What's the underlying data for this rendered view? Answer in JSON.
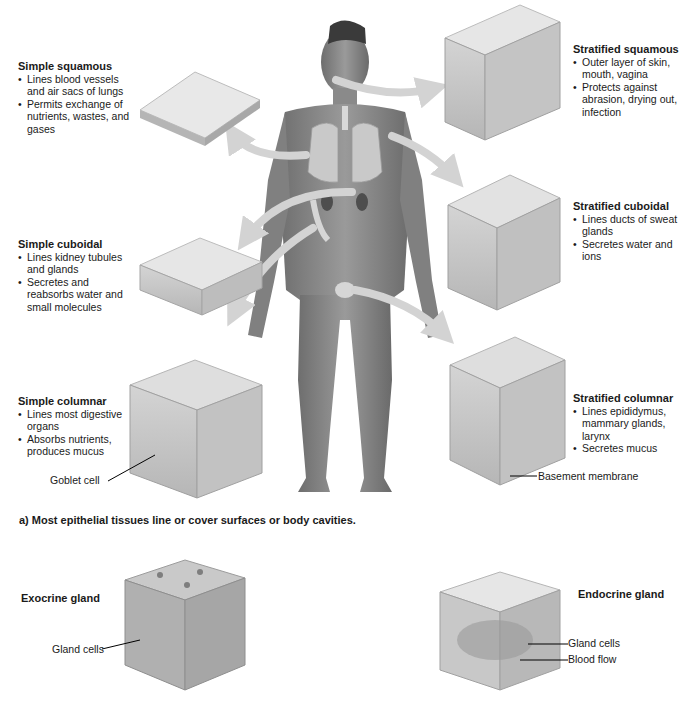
{
  "figure": {
    "caption": "a) Most epithelial tissues line or cover surfaces or body cavities.",
    "central_image": "human-body-front-view",
    "tissues": [
      {
        "id": "simple-squamous",
        "title": "Simple squamous",
        "bullets": [
          "Lines blood vessels and air sacs of lungs",
          "Permits exchange of nutrients, wastes, and gases"
        ],
        "source_organ": "lungs"
      },
      {
        "id": "simple-cuboidal",
        "title": "Simple cuboidal",
        "bullets": [
          "Lines kidney tubules and glands",
          "Secretes and reabsorbs water and small molecules"
        ],
        "source_organ": "kidneys"
      },
      {
        "id": "simple-columnar",
        "title": "Simple columnar",
        "bullets": [
          "Lines most digestive organs",
          "Absorbs nutrients, produces mucus"
        ],
        "source_organ": "intestines",
        "callout": "Goblet cell"
      },
      {
        "id": "stratified-squamous",
        "title": "Stratified squamous",
        "bullets": [
          "Outer layer of skin, mouth, vagina",
          "Protects against abrasion, drying out, infection"
        ],
        "source_organ": "mouth"
      },
      {
        "id": "stratified-cuboidal",
        "title": "Stratified cuboidal",
        "bullets": [
          "Lines ducts of sweat glands",
          "Secretes water and ions"
        ],
        "source_organ": "skin"
      },
      {
        "id": "stratified-columnar",
        "title": "Stratified columnar",
        "bullets": [
          "Lines epididymus, mammary glands, larynx",
          "Secretes mucus"
        ],
        "source_organ": "epididymis",
        "callout": "Basement membrane"
      }
    ],
    "glands": [
      {
        "id": "exocrine",
        "title": "Exocrine gland",
        "callouts": [
          "Gland cells"
        ]
      },
      {
        "id": "endocrine",
        "title": "Endocrine gland",
        "callouts": [
          "Gland cells",
          "Blood flow"
        ]
      }
    ]
  }
}
